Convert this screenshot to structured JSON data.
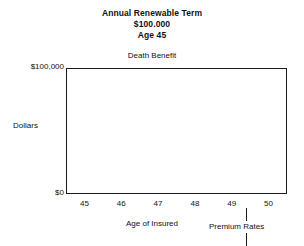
{
  "chart_data": {
    "type": "bar",
    "title": "Annual Renewable Term",
    "subtitle": "$100.000",
    "subtitle2": "Age 45",
    "xlabel": "Age of Insured",
    "ylabel": "Dollars",
    "categories": [
      "45",
      "46",
      "47",
      "48",
      "49",
      "50"
    ],
    "series": [
      {
        "name": "Premium Rates",
        "values": [
          32000,
          37000,
          44000,
          52000,
          60000,
          64000
        ]
      },
      {
        "name": "Death Benefit",
        "values": [
          100000,
          100000,
          100000,
          100000,
          100000,
          100000
        ]
      }
    ],
    "ylim": [
      0,
      100000
    ],
    "ytick_labels": [
      "$0",
      "$100,000"
    ],
    "grid": false,
    "legend": "none",
    "annotations": [
      {
        "text": "Death Benefit",
        "position": "above-plot-center"
      },
      {
        "text": "Premium Rates",
        "position": "inside-plot-center"
      }
    ],
    "colors": {
      "premium_fill": "#cfcfcf",
      "benefit_fill": "#ffffff",
      "outline": "#1a1a1a"
    }
  },
  "figure": {
    "title_lines": [
      "Annual Renewable Term",
      "$100.000",
      "Age 45"
    ],
    "death_benefit_label": "Death Benefit",
    "premium_rates_label": "Premium Rates",
    "y_axis_title": "Dollars",
    "y_tick_top": "$100,000",
    "y_tick_bottom": "$0",
    "x_axis_title": "Age of Insured",
    "x_ticks": [
      "45",
      "46",
      "47",
      "48",
      "49",
      "50"
    ]
  }
}
